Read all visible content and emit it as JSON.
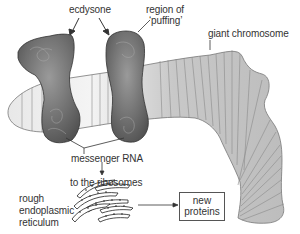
{
  "diagram": {
    "labels": {
      "ecdysone": "ecdysone",
      "puffing_line1": "region of",
      "puffing_line2": "‘puffing’",
      "giant_chromosome": "giant chromosome",
      "messenger_rna": "messenger RNA",
      "to_ribosomes": "to the ribosomes",
      "rer_line1": "rough",
      "rer_line2": "endoplasmic",
      "rer_line3": "reticulum",
      "new_proteins_line1": "new",
      "new_proteins_line2": "proteins"
    },
    "colors": {
      "chromosome_fill": "#cfcfcf",
      "chromosome_band": "#8a8a8a",
      "puff_fill": "#6b6b6b",
      "text": "#333333",
      "line": "#333333"
    }
  }
}
